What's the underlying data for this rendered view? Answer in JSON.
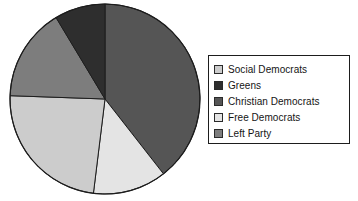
{
  "chart_data": {
    "type": "pie",
    "title": "",
    "categories": [
      "Social Democrats",
      "Greens",
      "Christian Democrats",
      "Free Democrats",
      "Left Party"
    ],
    "values": [
      23.6,
      8.6,
      39.4,
      12.5,
      15.9
    ],
    "units": "percent",
    "start_angle_deg": 0,
    "direction": "clockwise",
    "slice_order_clockwise_from_top": [
      "Christian Democrats",
      "Free Democrats",
      "Social Democrats",
      "Left Party",
      "Greens"
    ],
    "slice_boundaries_deg": [
      0,
      142,
      187,
      272,
      329,
      360
    ],
    "colors": {
      "Social Democrats": "#cccccc",
      "Greens": "#2e2e2e",
      "Christian Democrats": "#555555",
      "Free Democrats": "#e4e4e4",
      "Left Party": "#7d7d7d"
    },
    "legend_position": "right",
    "grid": false,
    "xlabel": "",
    "ylabel": ""
  },
  "legend": {
    "items": [
      {
        "label": "Social Democrats",
        "color": "#cccccc"
      },
      {
        "label": "Greens",
        "color": "#2e2e2e"
      },
      {
        "label": "Christian Democrats",
        "color": "#555555"
      },
      {
        "label": "Free Democrats",
        "color": "#e4e4e4"
      },
      {
        "label": "Left Party",
        "color": "#7d7d7d"
      }
    ]
  },
  "pie": {
    "center_x": 105,
    "center_y": 99,
    "radius": 95,
    "outline_color": "#1d1d1d"
  }
}
